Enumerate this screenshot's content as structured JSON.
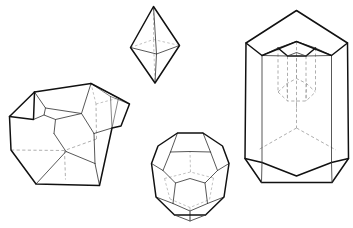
{
  "figure": {
    "background_color": "#ffffff",
    "canvas": {
      "width": 353,
      "height": 228
    },
    "line_styles": {
      "outline_color": "#111111",
      "visible_edge_color": "#3a3a3a",
      "hidden_edge_color": "#9a9a9a",
      "hidden_edge_dash": "3.2 2.4"
    }
  },
  "crystals": [
    {
      "id": "bipyramid",
      "name": "Tetragonal bipyramid",
      "position": "top-center",
      "faces": 8,
      "vertices": 6,
      "edges": 12,
      "bbox": {
        "x": 128,
        "y": 4,
        "width": 54,
        "height": 80
      }
    },
    {
      "id": "truncated-block",
      "name": "Truncated rhombohedral block",
      "position": "left",
      "faces": 11,
      "vertices": 18,
      "edges": 27,
      "bbox": {
        "x": 8,
        "y": 68,
        "width": 122,
        "height": 118
      }
    },
    {
      "id": "pyritohedron",
      "name": "Pentagonal dodecahedron (pyritohedron)",
      "position": "bottom-center",
      "faces": 12,
      "vertices": 20,
      "edges": 30,
      "bbox": {
        "x": 150,
        "y": 128,
        "width": 80,
        "height": 94
      }
    },
    {
      "id": "hexagonal-prism",
      "name": "Hexagonal prism with negative-crystal inclusion",
      "position": "right",
      "faces": 8,
      "vertices": 12,
      "edges": 18,
      "inclusion": "hexagonal prism with pyramidal termination",
      "bbox": {
        "x": 243,
        "y": 8,
        "width": 106,
        "height": 178
      }
    }
  ]
}
